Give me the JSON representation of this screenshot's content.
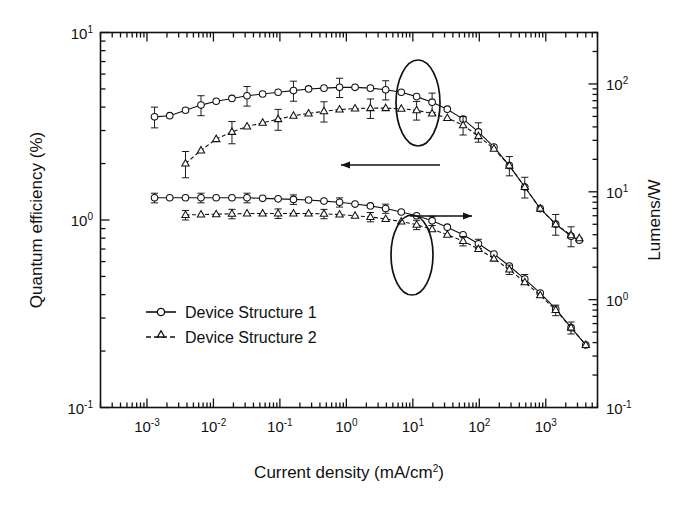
{
  "figure": {
    "background": "#ffffff",
    "ink": "#111111"
  },
  "axes": {
    "left": {
      "title": "Quantum efficiency (%)",
      "ticks": [
        "10",
        "10",
        "10"
      ],
      "tick_exponents": [
        "1",
        "0",
        "-1"
      ],
      "tick_values": [
        10,
        1,
        0.1
      ],
      "scale": "log",
      "range": [
        0.1,
        10
      ]
    },
    "right": {
      "title": "Lumens/W",
      "ticks": [
        "10",
        "10",
        "10",
        "10"
      ],
      "tick_exponents": [
        "2",
        "1",
        "0",
        "-1"
      ],
      "tick_values": [
        100,
        10,
        1,
        0.1
      ],
      "scale": "log",
      "range": [
        0.1,
        300
      ]
    },
    "bottom": {
      "title": "Current density (mA/cm",
      "title_sup": "2",
      "title_tail": ")",
      "ticks": [
        "10",
        "10",
        "10",
        "10",
        "10",
        "10",
        "10"
      ],
      "tick_exponents": [
        "-3",
        "-2",
        "-1",
        "0",
        "1",
        "2",
        "3"
      ],
      "tick_values": [
        0.001,
        0.01,
        0.1,
        1,
        10,
        100,
        1000
      ],
      "scale": "log",
      "range": [
        0.0002,
        6000
      ]
    }
  },
  "legend": {
    "items": [
      {
        "label": "Device Structure 1",
        "marker": "circle",
        "line": "solid"
      },
      {
        "label": "Device Structure 2",
        "marker": "triangle",
        "line": "dashed"
      }
    ]
  },
  "annotations": {
    "upper_ellipse": {
      "cx": 418,
      "cy": 103,
      "rx": 22,
      "ry": 43
    },
    "lower_ellipse": {
      "cx": 412,
      "cy": 255,
      "rx": 21,
      "ry": 40
    },
    "left_arrow": {
      "x1": 440,
      "y1": 165,
      "x2": 341,
      "y2": 165,
      "points_to": "left-axis"
    },
    "right_arrow": {
      "x1": 410,
      "y1": 216,
      "x2": 472,
      "y2": 216,
      "points_to": "right-axis"
    }
  },
  "chart_data": {
    "type": "line",
    "title": "",
    "xlabel": "Current density (mA/cm2)",
    "ylabel": "Quantum efficiency (%)",
    "y2label": "Lumens/W",
    "xscale": "log",
    "yscale": "log",
    "xlim": [
      0.0002,
      6000
    ],
    "ylim": [
      0.1,
      10
    ],
    "y2lim": [
      0.1,
      300
    ],
    "grid": false,
    "legend_position": "lower-left-inside",
    "series": [
      {
        "name": "Device Structure 1",
        "axis": "left",
        "marker": "circle",
        "line": "solid",
        "units": "quantum efficiency (%)",
        "x": [
          0.0013,
          0.0022,
          0.0038,
          0.0065,
          0.011,
          0.019,
          0.032,
          0.055,
          0.094,
          0.16,
          0.27,
          0.46,
          0.79,
          1.35,
          2.3,
          3.9,
          6.7,
          11.4,
          19.5,
          33,
          57,
          97,
          166,
          283,
          483,
          825,
          1410,
          2400,
          3200
        ],
        "y": [
          3.55,
          3.6,
          3.85,
          4.1,
          4.3,
          4.45,
          4.6,
          4.7,
          4.8,
          4.9,
          5.0,
          5.05,
          5.1,
          5.1,
          5.05,
          4.95,
          4.8,
          4.55,
          4.25,
          3.9,
          3.45,
          2.95,
          2.45,
          1.95,
          1.5,
          1.15,
          0.95,
          0.82,
          0.78
        ],
        "yerr": [
          0.45,
          0.45,
          0.5,
          0.5,
          0.52,
          0.54,
          0.55,
          0.56,
          0.58,
          0.6,
          0.6,
          0.6,
          0.6,
          0.6,
          0.6,
          0.58,
          0.56,
          0.54,
          0.5,
          0.46,
          0.4,
          0.35,
          0.3,
          0.24,
          0.19,
          0.15,
          0.12,
          0.1,
          0.1
        ]
      },
      {
        "name": "Device Structure 2",
        "axis": "left",
        "marker": "triangle",
        "line": "dashed",
        "units": "quantum efficiency (%)",
        "x": [
          0.0038,
          0.0065,
          0.011,
          0.019,
          0.032,
          0.055,
          0.094,
          0.16,
          0.27,
          0.46,
          0.79,
          1.35,
          2.3,
          3.9,
          6.7,
          11.4,
          19.5,
          33,
          57,
          97,
          166,
          283,
          483,
          825,
          1410,
          2400,
          3200
        ],
        "y": [
          2.0,
          2.35,
          2.7,
          2.95,
          3.15,
          3.3,
          3.45,
          3.6,
          3.7,
          3.8,
          3.88,
          3.93,
          3.95,
          3.95,
          3.92,
          3.85,
          3.7,
          3.5,
          3.2,
          2.8,
          2.4,
          1.95,
          1.5,
          1.15,
          0.95,
          0.83,
          0.8
        ],
        "yerr": [
          0.32,
          0.35,
          0.38,
          0.4,
          0.42,
          0.43,
          0.44,
          0.45,
          0.46,
          0.47,
          0.47,
          0.47,
          0.47,
          0.46,
          0.45,
          0.44,
          0.42,
          0.4,
          0.36,
          0.32,
          0.28,
          0.23,
          0.18,
          0.14,
          0.12,
          0.1,
          0.1
        ]
      },
      {
        "name": "Device Structure 1",
        "axis": "right",
        "marker": "circle",
        "line": "solid",
        "units": "lumens/W",
        "x": [
          0.0013,
          0.0022,
          0.0038,
          0.0065,
          0.011,
          0.019,
          0.032,
          0.055,
          0.094,
          0.16,
          0.27,
          0.46,
          0.79,
          1.35,
          2.3,
          3.9,
          6.7,
          11.4,
          19.5,
          33,
          57,
          97,
          166,
          283,
          483,
          825,
          1410,
          2400,
          4000
        ],
        "y": [
          8.8,
          8.8,
          8.8,
          8.8,
          8.8,
          8.8,
          8.8,
          8.7,
          8.6,
          8.5,
          8.4,
          8.2,
          8.0,
          7.7,
          7.4,
          7.0,
          6.5,
          6.0,
          5.4,
          4.7,
          4.0,
          3.3,
          2.65,
          2.05,
          1.55,
          1.15,
          0.82,
          0.55,
          0.38
        ],
        "yerr": [
          0.9,
          0.9,
          0.9,
          0.9,
          0.9,
          0.9,
          0.9,
          0.9,
          0.88,
          0.86,
          0.84,
          0.8,
          0.78,
          0.75,
          0.72,
          0.68,
          0.63,
          0.58,
          0.53,
          0.46,
          0.4,
          0.33,
          0.27,
          0.21,
          0.16,
          0.12,
          0.09,
          0.07,
          0.06
        ]
      },
      {
        "name": "Device Structure 2",
        "axis": "right",
        "marker": "triangle",
        "line": "dashed",
        "units": "lumens/W",
        "x": [
          0.0038,
          0.0065,
          0.011,
          0.019,
          0.032,
          0.055,
          0.094,
          0.16,
          0.27,
          0.46,
          0.79,
          1.35,
          2.3,
          3.9,
          6.7,
          11.4,
          19.5,
          33,
          57,
          97,
          166,
          283,
          483,
          825,
          1410,
          2400,
          4000
        ],
        "y": [
          6.1,
          6.15,
          6.2,
          6.25,
          6.3,
          6.3,
          6.3,
          6.3,
          6.3,
          6.25,
          6.15,
          6.0,
          5.85,
          5.6,
          5.3,
          4.95,
          4.5,
          4.0,
          3.5,
          2.95,
          2.4,
          1.9,
          1.45,
          1.1,
          0.8,
          0.55,
          0.38
        ],
        "yerr": [
          0.62,
          0.62,
          0.63,
          0.63,
          0.64,
          0.64,
          0.64,
          0.64,
          0.63,
          0.62,
          0.61,
          0.6,
          0.58,
          0.55,
          0.52,
          0.49,
          0.45,
          0.4,
          0.35,
          0.3,
          0.24,
          0.19,
          0.15,
          0.11,
          0.09,
          0.07,
          0.06
        ]
      }
    ]
  }
}
